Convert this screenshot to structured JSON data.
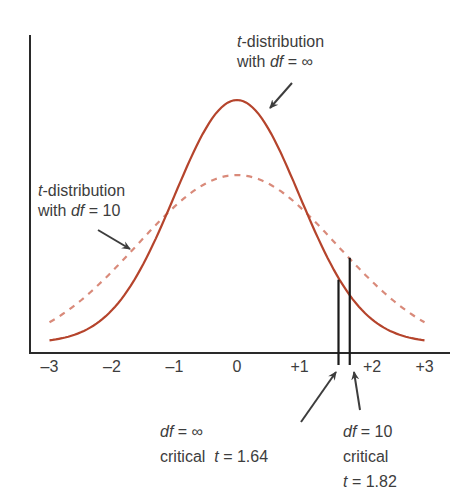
{
  "chart_data": {
    "type": "line",
    "title": "",
    "xlabel": "",
    "ylabel": "",
    "xlim": [
      -3,
      3
    ],
    "x_ticks": [
      "–3",
      "–2",
      "–1",
      "0",
      "+1",
      "+2",
      "+3"
    ],
    "x_tick_values": [
      -3,
      -2,
      -1,
      0,
      1,
      2,
      3
    ],
    "grid": false,
    "series": [
      {
        "name": "t-distribution with df = ∞",
        "style": "solid",
        "color": "#b5442c",
        "peak_relative_height": 1.0
      },
      {
        "name": "t-distribution with df = 10",
        "style": "dashed",
        "color": "#d98a7a",
        "peak_relative_height": 0.7
      }
    ],
    "critical_values": [
      {
        "df": "∞",
        "t": 1.64,
        "label": "df = ∞ critical t = 1.64"
      },
      {
        "df": "10",
        "t": 1.82,
        "label": "df = 10 critical t = 1.82"
      }
    ]
  },
  "labels": {
    "top": {
      "line1_italic": "t",
      "line1_rest": "-distribution",
      "line2_pre": "with ",
      "line2_italic": "df",
      "line2_rest": " = ∞"
    },
    "left": {
      "line1_italic": "t",
      "line1_rest": "-distribution",
      "line2_pre": "with ",
      "line2_italic": "df",
      "line2_rest": " = 10"
    },
    "crit_inf": {
      "line1_italic": "df",
      "line1_rest": " = ∞",
      "line2_pre": "critical  ",
      "line2_italic": "t",
      "line2_rest": " = 1.64"
    },
    "crit_10": {
      "line1_italic": "df",
      "line1_rest": " = 10",
      "line2": "critical",
      "line3_italic": "t",
      "line3_rest": " = 1.82"
    }
  },
  "colors": {
    "solid": "#b5442c",
    "dashed": "#d98a7a",
    "axis": "#2a2a2a",
    "text": "#3d3d3d"
  }
}
